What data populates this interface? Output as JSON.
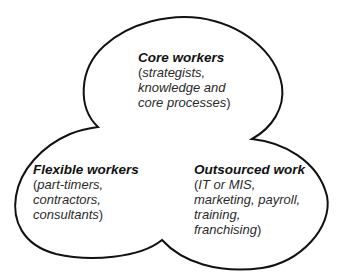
{
  "diagram": {
    "type": "shamrock-organization",
    "outline_color": "#111111",
    "background": "#ffffff",
    "leaves": [
      {
        "id": "core",
        "title": "Core workers",
        "open_paren": "(",
        "lines": [
          "strategists,",
          "knowledge and",
          "core processes"
        ],
        "close_paren": ")"
      },
      {
        "id": "flexible",
        "title": "Flexible workers",
        "open_paren": "(",
        "lines": [
          "part-timers,",
          "contractors,",
          "consultants"
        ],
        "close_paren": ")"
      },
      {
        "id": "outsourced",
        "title": "Outsourced work",
        "open_paren": "(",
        "lines": [
          "IT or MIS,",
          "marketing, payroll,",
          "training,",
          "franchising"
        ],
        "close_paren": ")"
      }
    ]
  }
}
